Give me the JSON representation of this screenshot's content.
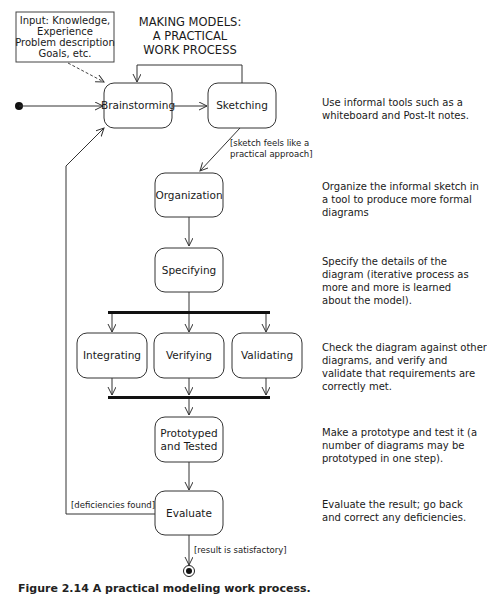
{
  "title": [
    "MAKING MODELS:",
    "A PRACTICAL",
    "WORK PROCESS"
  ],
  "input_note": [
    "Input: Knowledge,",
    "Experience",
    "Problem description",
    "Goals, etc."
  ],
  "nodes": {
    "brainstorming": [
      "Brainstorming"
    ],
    "sketching": [
      "Sketching"
    ],
    "organization": [
      "Organization"
    ],
    "specifying": [
      "Specifying"
    ],
    "integrating": [
      "Integrating"
    ],
    "verifying": [
      "Verifying"
    ],
    "validating": [
      "Validating"
    ],
    "prototyped": [
      "Prototyped",
      "and Tested"
    ],
    "evaluate": [
      "Evaluate"
    ]
  },
  "guards": {
    "sketch_ok": [
      "[sketch feels like a",
      "practical approach]"
    ],
    "deficiencies": "[deficiencies found]",
    "satisfactory": "[result is satisfactory]"
  },
  "descriptions": {
    "brainstorm": "Use informal tools such as a whiteboard and Post-It notes.",
    "organize": "Organize the informal sketch in a tool to produce more formal diagrams",
    "specify": "Specify the details of the diagram (iterative process as more and more is learned about the model).",
    "check": "Check the diagram against other diagrams, and verify and validate that requirements are correctly met.",
    "prototype": "Make a prototype and test it (a number of diagrams may be prototyped in one step).",
    "evaluate": "Evaluate the result; go back and correct any deficiencies."
  },
  "caption": "Figure 2.14 A practical modeling work process."
}
